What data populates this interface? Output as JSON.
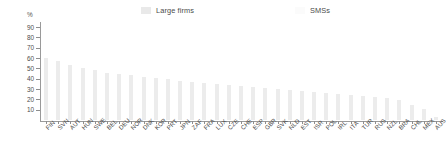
{
  "legend": {
    "items": [
      {
        "label": "Large firms",
        "color": "#e9e9e9",
        "name": "legend-large-firms"
      },
      {
        "label": "SMSs",
        "color": "#fbfbfb",
        "name": "legend-smes"
      }
    ]
  },
  "axis": {
    "unit": "%",
    "y_ticks": [
      "10",
      "20",
      "30",
      "40",
      "50",
      "60",
      "70",
      "80",
      "90"
    ]
  },
  "chart_data": {
    "type": "bar",
    "title": "",
    "subtitle": "",
    "xlabel": "",
    "ylabel": "%",
    "ylim": [
      0,
      95
    ],
    "grid": false,
    "legend_position": "top",
    "categories": [
      "FIN",
      "SVN",
      "AUT",
      "HUN",
      "SWE",
      "BEL",
      "DEU",
      "NOR",
      "DNK",
      "KOR",
      "PRT",
      "JPN",
      "ZAF",
      "FRA",
      "LUX",
      "CZE",
      "CHE",
      "ESP",
      "GBR",
      "SVK",
      "NLD",
      "EST",
      "ISR",
      "POL",
      "IRL",
      "ITA",
      "TUR",
      "RUS",
      "NZL",
      "BRA",
      "CHL",
      "MEX",
      "AUS"
    ],
    "series": [
      {
        "name": "Large firms",
        "values": [
          60,
          57,
          53,
          50,
          48,
          46,
          45,
          44,
          42,
          41,
          40,
          38,
          37,
          36,
          35,
          34,
          33,
          32,
          31,
          30,
          29,
          28,
          27,
          26,
          25,
          24,
          23,
          22,
          21,
          19,
          15,
          11,
          3
        ]
      }
    ]
  }
}
